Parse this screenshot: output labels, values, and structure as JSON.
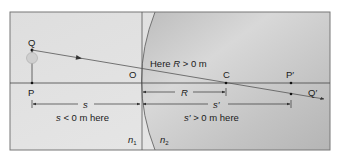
{
  "diagram": {
    "colors": {
      "left_medium": "#e4e4e4",
      "right_medium": "#c7c7c7",
      "frame": "#777777",
      "ray": "#555555",
      "line": "#333333"
    },
    "points": {
      "Q": "Q",
      "P": "P",
      "O": "O",
      "C": "C",
      "P_prime": "P′",
      "Q_prime": "Q′"
    },
    "annotations": {
      "radius_note": "Here R > 0  m",
      "radius_note_prefix": "Here ",
      "radius_note_var": "R",
      "radius_note_suffix": " > 0  m",
      "s_label": "s",
      "s_note_var": "s",
      "s_note_suffix": " < 0  m here",
      "R_label": "R",
      "s_prime_label": "s′",
      "s_prime_note_var": "s′",
      "s_prime_note_suffix": " > 0  m here"
    },
    "media": {
      "n1": "n",
      "n1_sub": "1",
      "n2": "n",
      "n2_sub": "2"
    },
    "icons": [
      "object-source-icon",
      "ray-arrow-icon",
      "dimension-arrow-icon"
    ]
  }
}
